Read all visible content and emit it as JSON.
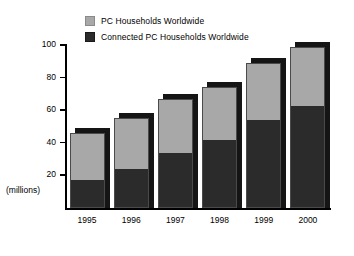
{
  "chart_data": {
    "type": "bar",
    "subtype": "stacked-vertical",
    "title": "",
    "xlabel": "",
    "ylabel": "(millions)",
    "ylim": [
      0,
      100
    ],
    "yticks": [
      20,
      40,
      60,
      80,
      100
    ],
    "grid": false,
    "legend_position": "top",
    "categories": [
      "1995",
      "1996",
      "1997",
      "1998",
      "1999",
      "2000"
    ],
    "series": [
      {
        "name": "Connected PC Households Worldwide",
        "color": "#2b2b2b",
        "values": [
          17,
          24,
          34,
          42,
          54,
          63
        ]
      },
      {
        "name": "PC Households Worldwide",
        "color": "#a8a8a8",
        "note": "upper segment; totals shown are the full bar height",
        "values": [
          29,
          31,
          33,
          32,
          35,
          36
        ]
      }
    ],
    "totals": [
      46,
      55,
      67,
      74,
      89,
      99
    ]
  },
  "legend": {
    "items": [
      {
        "label": "PC Households Worldwide",
        "swatch": "gray-swatch-icon"
      },
      {
        "label": "Connected PC Households Worldwide",
        "swatch": "dark-swatch-icon"
      }
    ]
  },
  "yaxis": {
    "units": "(millions)",
    "ticks": [
      "100",
      "80",
      "60",
      "40",
      "20"
    ]
  },
  "xaxis": {
    "ticks": [
      "1995",
      "1996",
      "1997",
      "1998",
      "1999",
      "2000"
    ]
  },
  "colors": {
    "series_gray": "#a8a8a8",
    "series_dark": "#2b2b2b",
    "shadow": "#151515",
    "axis": "#000000",
    "background": "#ffffff"
  }
}
